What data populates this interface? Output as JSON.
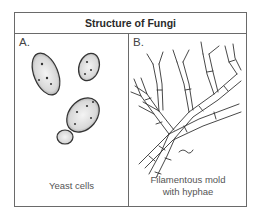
{
  "figure": {
    "title": "Structure of Fungi",
    "panels": [
      {
        "label": "A.",
        "caption": "Yeast cells",
        "illustration": "yeast-cells-drawing"
      },
      {
        "label": "B.",
        "caption_line1": "Filamentous mold",
        "caption_line2": "with hyphae",
        "illustration": "branching-hyphae-drawing"
      }
    ]
  }
}
